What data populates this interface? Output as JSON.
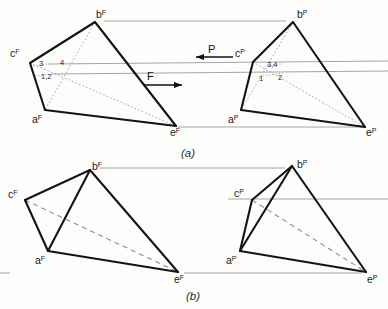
{
  "figure": {
    "width": 388,
    "height": 309,
    "background_color": "#fdfdfc",
    "ink_color": "#1a1a1a",
    "thin_line_color": "#9a9a9a",
    "dashed_line_color": "#8e8e8e"
  },
  "captions": {
    "part_a": "(a)",
    "part_b": "(b)"
  },
  "force_labels": {
    "f": "F",
    "p": "P"
  },
  "panel_a": {
    "front_view": {
      "vertex_labels": [
        {
          "base": "b",
          "sup": "F",
          "x": 96,
          "y": 18
        },
        {
          "base": "c",
          "sup": "F",
          "x": 10,
          "y": 57
        },
        {
          "base": "a",
          "sup": "F",
          "x": 32,
          "y": 123
        },
        {
          "base": "e",
          "sup": "F",
          "x": 170,
          "y": 136
        }
      ],
      "number_labels": [
        {
          "text": "3",
          "x": 39,
          "y": 66
        },
        {
          "text": "4",
          "x": 60,
          "y": 65
        },
        {
          "text": "1,2",
          "x": 41,
          "y": 78
        }
      ]
    },
    "profile_view": {
      "vertex_labels": [
        {
          "base": "b",
          "sup": "P",
          "x": 297,
          "y": 18
        },
        {
          "base": "c",
          "sup": "P",
          "x": 235,
          "y": 57
        },
        {
          "base": "a",
          "sup": "P",
          "x": 228,
          "y": 123
        },
        {
          "base": "e",
          "sup": "P",
          "x": 366,
          "y": 136
        }
      ],
      "number_labels": [
        {
          "text": "3,4",
          "x": 267,
          "y": 66
        },
        {
          "text": "1",
          "x": 258,
          "y": 80
        },
        {
          "text": "2",
          "x": 277,
          "y": 79
        }
      ]
    }
  },
  "panel_b": {
    "front_view": {
      "vertex_labels": [
        {
          "base": "b",
          "sup": "F",
          "x": 92,
          "y": 170
        },
        {
          "base": "c",
          "sup": "F",
          "x": 8,
          "y": 198
        },
        {
          "base": "a",
          "sup": "F",
          "x": 35,
          "y": 263
        },
        {
          "base": "e",
          "sup": "F",
          "x": 174,
          "y": 282
        }
      ]
    },
    "profile_view": {
      "vertex_labels": [
        {
          "base": "b",
          "sup": "P",
          "x": 297,
          "y": 168
        },
        {
          "base": "c",
          "sup": "P",
          "x": 234,
          "y": 197
        },
        {
          "base": "a",
          "sup": "P",
          "x": 226,
          "y": 263
        },
        {
          "base": "e",
          "sup": "P",
          "x": 367,
          "y": 282
        }
      ]
    }
  },
  "geometry": {
    "panel_a_front": {
      "a": [
        45,
        110
      ],
      "b": [
        95,
        22
      ],
      "c": [
        30,
        63
      ],
      "e": [
        176,
        126
      ]
    },
    "panel_a_profile": {
      "a": [
        241,
        110
      ],
      "b": [
        293,
        22
      ],
      "c": [
        253,
        62
      ],
      "e": [
        365,
        127
      ]
    },
    "panel_b_front": {
      "a": [
        48,
        251
      ],
      "b": [
        90,
        170
      ],
      "c": [
        25,
        200
      ],
      "e": [
        178,
        272
      ]
    },
    "panel_b_profile": {
      "a": [
        240,
        251
      ],
      "b": [
        292,
        166
      ],
      "c": [
        252,
        200
      ],
      "e": [
        366,
        272
      ]
    }
  }
}
